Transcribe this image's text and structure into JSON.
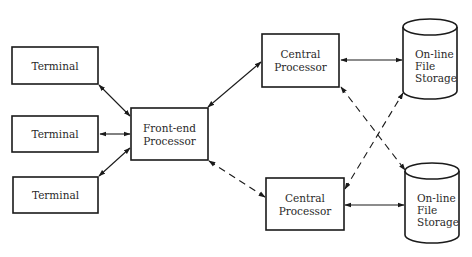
{
  "diagram": {
    "nodes": [
      {
        "id": "terminal-1",
        "type": "box",
        "lines": [
          "Terminal"
        ]
      },
      {
        "id": "terminal-2",
        "type": "box",
        "lines": [
          "Terminal"
        ]
      },
      {
        "id": "terminal-3",
        "type": "box",
        "lines": [
          "Terminal"
        ]
      },
      {
        "id": "front-end-processor",
        "type": "box",
        "lines": [
          "Front-end",
          "Processor"
        ]
      },
      {
        "id": "central-processor-1",
        "type": "box",
        "lines": [
          "Central",
          "Processor"
        ]
      },
      {
        "id": "central-processor-2",
        "type": "box",
        "lines": [
          "Central",
          "Processor"
        ]
      },
      {
        "id": "file-storage-1",
        "type": "cylinder",
        "lines": [
          "On-line",
          "File",
          "Storage"
        ]
      },
      {
        "id": "file-storage-2",
        "type": "cylinder",
        "lines": [
          "On-line",
          "File",
          "Storage"
        ]
      }
    ],
    "edges": [
      {
        "from": "terminal-1",
        "to": "front-end-processor",
        "style": "solid",
        "direction": "both"
      },
      {
        "from": "terminal-2",
        "to": "front-end-processor",
        "style": "solid",
        "direction": "both"
      },
      {
        "from": "terminal-3",
        "to": "front-end-processor",
        "style": "solid",
        "direction": "both"
      },
      {
        "from": "front-end-processor",
        "to": "central-processor-1",
        "style": "solid",
        "direction": "both"
      },
      {
        "from": "front-end-processor",
        "to": "central-processor-2",
        "style": "dashed",
        "direction": "both"
      },
      {
        "from": "central-processor-1",
        "to": "file-storage-1",
        "style": "solid",
        "direction": "both"
      },
      {
        "from": "central-processor-2",
        "to": "file-storage-2",
        "style": "solid",
        "direction": "both"
      },
      {
        "from": "central-processor-1",
        "to": "file-storage-2",
        "style": "dashed",
        "direction": "both"
      },
      {
        "from": "central-processor-2",
        "to": "file-storage-1",
        "style": "dashed",
        "direction": "both"
      }
    ]
  }
}
